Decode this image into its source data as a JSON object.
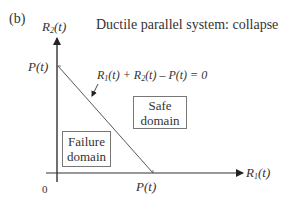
{
  "panel_label": "(b)",
  "title": "Ductile parallel system: collapse",
  "axes": {
    "y_label_main": "R",
    "y_label_sub": "2",
    "y_label_arg": "(t)",
    "x_label_main": "R",
    "x_label_sub": "1",
    "x_label_arg": "(t)",
    "origin": "0",
    "y_intercept": "P(t)",
    "x_intercept": "P(t)"
  },
  "limit_state": {
    "r1": "R",
    "r1_sub": "1",
    "r1_arg": "(t) + ",
    "r2": "R",
    "r2_sub": "2",
    "r2_arg": "(t) – P(t) = 0"
  },
  "regions": {
    "safe_line1": "Safe",
    "safe_line2": "domain",
    "failure_line1": "Failure",
    "failure_line2": "domain"
  },
  "colors": {
    "line": "#333333",
    "box_border": "#777777",
    "text": "#333333"
  }
}
